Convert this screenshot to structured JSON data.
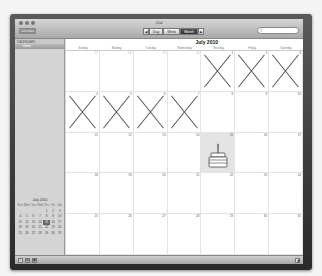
{
  "window": {
    "app_title": "iCal",
    "calendars_button": "Calendars",
    "search_placeholder": "Q-"
  },
  "toolbar": {
    "prev_arrow": "◀",
    "next_arrow": "▶",
    "views": [
      {
        "label": "Day",
        "active": false
      },
      {
        "label": "Week",
        "active": false
      },
      {
        "label": "Month",
        "active": true
      }
    ]
  },
  "sidebar": {
    "header": "CALENDARS",
    "items": [
      {
        "label": "Home"
      }
    ]
  },
  "main": {
    "month_title": "July 2010",
    "weekdays": [
      "Sunday",
      "Monday",
      "Tuesday",
      "Wednesday",
      "Thursday",
      "Friday",
      "Saturday"
    ],
    "weeks": [
      [
        {
          "n": "27",
          "other": true
        },
        {
          "n": "28",
          "other": true
        },
        {
          "n": "29",
          "other": true
        },
        {
          "n": "30",
          "other": true
        },
        {
          "n": "1",
          "x": true
        },
        {
          "n": "2",
          "x": true
        },
        {
          "n": "3",
          "x": true
        }
      ],
      [
        {
          "n": "4",
          "x": true
        },
        {
          "n": "5",
          "x": true
        },
        {
          "n": "6",
          "x": true
        },
        {
          "n": "7",
          "x": true
        },
        {
          "n": "8"
        },
        {
          "n": "9"
        },
        {
          "n": "10"
        }
      ],
      [
        {
          "n": "11"
        },
        {
          "n": "12"
        },
        {
          "n": "13"
        },
        {
          "n": "14"
        },
        {
          "n": "15",
          "today": true,
          "cake": true
        },
        {
          "n": "16"
        },
        {
          "n": "17"
        }
      ],
      [
        {
          "n": "18"
        },
        {
          "n": "19"
        },
        {
          "n": "20"
        },
        {
          "n": "21"
        },
        {
          "n": "22"
        },
        {
          "n": "23"
        },
        {
          "n": "24"
        }
      ],
      [
        {
          "n": "25"
        },
        {
          "n": "26"
        },
        {
          "n": "27"
        },
        {
          "n": "28"
        },
        {
          "n": "29"
        },
        {
          "n": "30"
        },
        {
          "n": "31"
        }
      ]
    ]
  },
  "mini_calendar": {
    "title": "July 2010",
    "weekday_abbr": [
      "Sun",
      "Mon",
      "Tue",
      "Wed",
      "Thu",
      "Fri",
      "Sat"
    ],
    "weeks": [
      [
        "",
        "",
        "",
        "",
        "1",
        "2",
        "3"
      ],
      [
        "4",
        "5",
        "6",
        "7",
        "8",
        "9",
        "10"
      ],
      [
        "11",
        "12",
        "13",
        "14",
        "15",
        "16",
        "17"
      ],
      [
        "18",
        "19",
        "20",
        "21",
        "22",
        "23",
        "24"
      ],
      [
        "25",
        "26",
        "27",
        "28",
        "29",
        "30",
        "31"
      ]
    ],
    "highlighted": "15"
  },
  "bottom_bar": {
    "buttons": [
      "+",
      "▤",
      "▦"
    ],
    "resize_icon": "resize-grip"
  },
  "colors": {
    "bezel": "#3c3c3c",
    "x_mark": "#555555",
    "today_bg": "#e4e4e4"
  }
}
